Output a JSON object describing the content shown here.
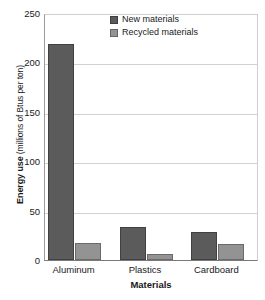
{
  "chart_data": {
    "type": "bar",
    "title": "",
    "xlabel": "Materials",
    "ylabel": "Energy use (millions of Btus per ton)",
    "ylabel_strong": "Energy use",
    "ylabel_rest": " (millions of Btus per ton)",
    "categories": [
      "Aluminum",
      "Plastics",
      "Cardboard"
    ],
    "series": [
      {
        "name": "New materials",
        "color": "#5b5b5b",
        "values": [
          219,
          33,
          28
        ]
      },
      {
        "name": "Recycled materials",
        "color": "#939393",
        "values": [
          17,
          6,
          16
        ]
      }
    ],
    "ylim": [
      0,
      250
    ],
    "yticks": [
      0,
      50,
      100,
      150,
      200,
      250
    ],
    "ytick_labels": [
      "0",
      "50",
      "100",
      "150",
      "200",
      "250"
    ],
    "grid": true,
    "grid_axis": "y",
    "legend_position": "top-center-right"
  },
  "legend": {
    "items": [
      {
        "label": "New materials",
        "swatch": "series-new"
      },
      {
        "label": "Recycled materials",
        "swatch": "series-recycled"
      }
    ]
  }
}
